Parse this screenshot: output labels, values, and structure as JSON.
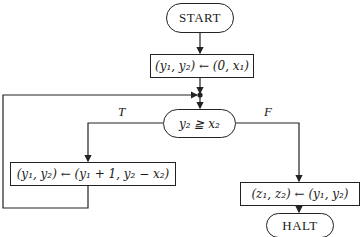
{
  "flowchart": {
    "start": {
      "label": "START"
    },
    "init": {
      "label": "(y₁, y₂) ← (0, x₁)"
    },
    "decision": {
      "label": "y₂ ≧ x₂"
    },
    "branch_true": {
      "label": "T"
    },
    "branch_false": {
      "label": "F"
    },
    "loop_body": {
      "label": "(y₁, y₂) ← (y₁ + 1, y₂ − x₂)"
    },
    "output": {
      "label": "(z₁, z₂) ← (y₁, y₂)"
    },
    "halt": {
      "label": "HALT"
    }
  },
  "colors": {
    "line": "#222222",
    "background": "#ffffff"
  }
}
